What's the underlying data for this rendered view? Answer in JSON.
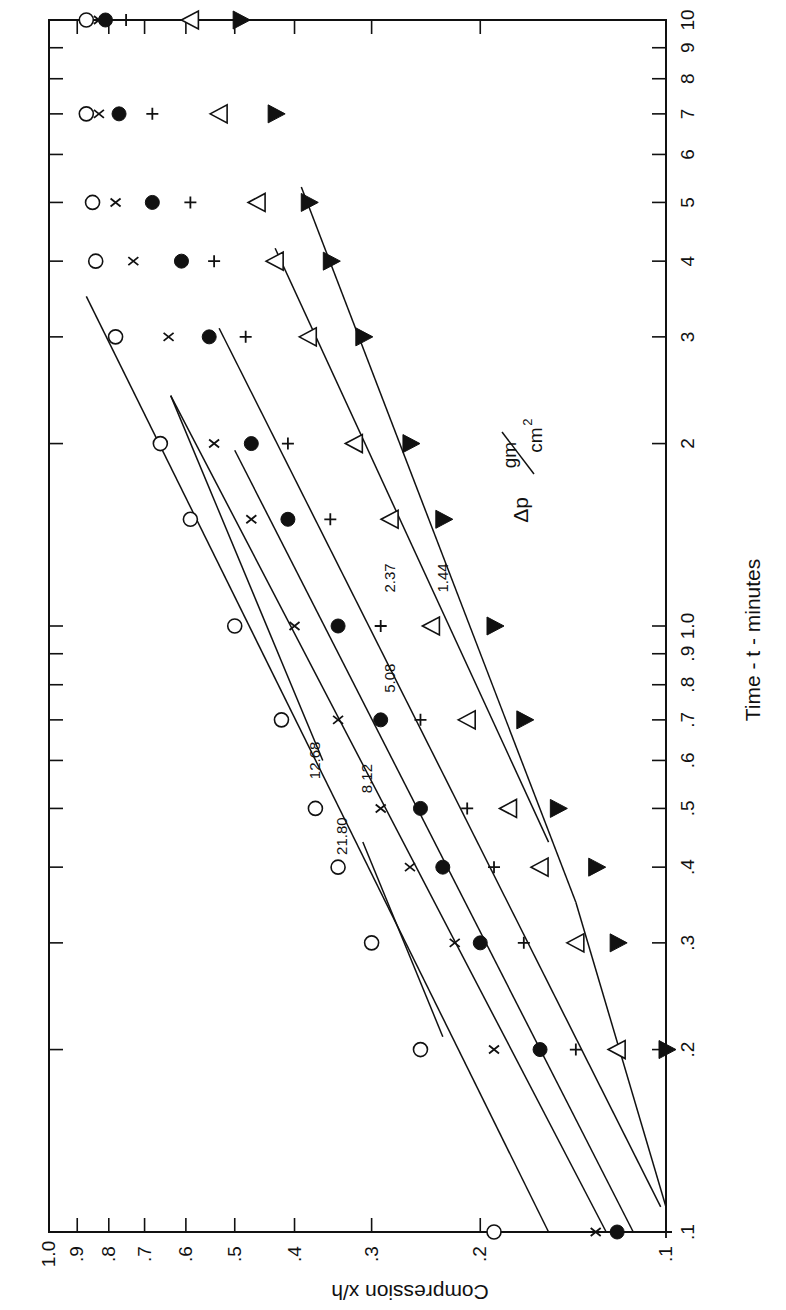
{
  "chart_data": {
    "type": "scatter",
    "orientation_note": "figure printed rotated 90 degrees counter-clockwise",
    "xlabel": "Time - t - minutes",
    "ylabel": "Compression x/h",
    "xscale": "log",
    "yscale": "log",
    "xlim": [
      0.1,
      10
    ],
    "ylim": [
      0.1,
      1.0
    ],
    "x_ticks": [
      ".1",
      ".2",
      ".3",
      ".4",
      ".5",
      ".6",
      ".7",
      ".8",
      ".9",
      "1.0",
      "2",
      "3",
      "4",
      "5",
      "6",
      "7",
      "8",
      "9",
      "10"
    ],
    "x_tick_values": [
      0.1,
      0.2,
      0.3,
      0.4,
      0.5,
      0.6,
      0.7,
      0.8,
      0.9,
      1.0,
      2,
      3,
      4,
      5,
      6,
      7,
      8,
      9,
      10
    ],
    "y_ticks": [
      ".1",
      ".2",
      ".3",
      ".4",
      ".5",
      ".6",
      ".7",
      ".8",
      ".9",
      "1.0"
    ],
    "y_tick_values": [
      0.1,
      0.2,
      0.3,
      0.4,
      0.5,
      0.6,
      0.7,
      0.8,
      0.9,
      1.0
    ],
    "legend_title": "Δp gm/cm²",
    "legend_title_parts": {
      "symbol": "Δp",
      "num": "gm",
      "den": "cm",
      "sup": "2"
    },
    "grid": false,
    "series": [
      {
        "name": "21.80",
        "marker": "open-circle",
        "x": [
          0.1,
          0.2,
          0.3,
          0.4,
          0.5,
          0.7,
          1.0,
          1.5,
          2,
          3,
          4,
          5,
          7,
          10
        ],
        "y": [
          0.19,
          0.25,
          0.3,
          0.34,
          0.37,
          0.42,
          0.5,
          0.59,
          0.66,
          0.78,
          0.84,
          0.85,
          0.87,
          0.87
        ],
        "fit": {
          "x1": 0.1,
          "y1": 0.155,
          "x2": 3.5,
          "y2": 0.87
        }
      },
      {
        "name": "12.68",
        "marker": "x",
        "x": [
          0.1,
          0.2,
          0.3,
          0.4,
          0.5,
          0.7,
          1.0,
          1.5,
          2,
          3,
          4,
          5,
          7,
          10
        ],
        "y": [
          0.13,
          0.19,
          0.22,
          0.26,
          0.29,
          0.34,
          0.4,
          0.47,
          0.54,
          0.64,
          0.73,
          0.78,
          0.83,
          0.83
        ],
        "fit": {
          "x1": 0.1,
          "y1": 0.125,
          "x2": 2.4,
          "y2": 0.635
        }
      },
      {
        "name": "8.12",
        "marker": "filled-circle",
        "x": [
          0.1,
          0.2,
          0.3,
          0.4,
          0.5,
          0.7,
          1.0,
          1.5,
          2,
          3,
          4,
          5,
          7,
          10
        ],
        "y": [
          0.12,
          0.16,
          0.2,
          0.23,
          0.25,
          0.29,
          0.34,
          0.41,
          0.47,
          0.55,
          0.61,
          0.68,
          0.77,
          0.81
        ],
        "fit": {
          "x1": 0.1,
          "y1": 0.113,
          "x2": 1.95,
          "y2": 0.5
        }
      },
      {
        "name": "5.08",
        "marker": "plus",
        "x": [
          0.1,
          0.2,
          0.3,
          0.4,
          0.5,
          0.7,
          1.0,
          1.5,
          2,
          3,
          4,
          5,
          7,
          10
        ],
        "y": [
          0.1,
          0.14,
          0.17,
          0.19,
          0.21,
          0.25,
          0.29,
          0.35,
          0.41,
          0.48,
          0.54,
          0.59,
          0.68,
          0.75
        ],
        "fit": {
          "x1": 0.11,
          "y1": 0.102,
          "x2": 3.1,
          "y2": 0.53
        }
      },
      {
        "name": "2.37",
        "marker": "open-triangle",
        "x": [
          0.2,
          0.3,
          0.4,
          0.5,
          0.7,
          1.0,
          1.5,
          2,
          3,
          4,
          5,
          7,
          10
        ],
        "y": [
          0.12,
          0.14,
          0.16,
          0.18,
          0.21,
          0.24,
          0.28,
          0.32,
          0.38,
          0.43,
          0.46,
          0.53,
          0.59
        ],
        "fit": {
          "x1": 0.44,
          "y1": 0.155,
          "x2": 4.2,
          "y2": 0.43
        }
      },
      {
        "name": "1.44",
        "marker": "filled-triangle",
        "x": [
          0.2,
          0.3,
          0.4,
          0.5,
          0.7,
          1.0,
          1.5,
          2,
          3,
          4,
          5,
          7,
          10
        ],
        "y": [
          0.1,
          0.12,
          0.13,
          0.15,
          0.17,
          0.19,
          0.23,
          0.26,
          0.31,
          0.35,
          0.38,
          0.43,
          0.49
        ],
        "fit": {
          "x1": 0.35,
          "y1": 0.14,
          "x2": 5.3,
          "y2": 0.39
        }
      }
    ],
    "extra_lines": [
      {
        "note": "short line near 21.80 label",
        "x1": 0.21,
        "y1": 0.23,
        "x2": 0.44,
        "y2": 0.31
      },
      {
        "note": "12.68 upper segment",
        "x1": 0.6,
        "y1": 0.36,
        "x2": 2.4,
        "y2": 0.635
      },
      {
        "note": "1.44 lower segment",
        "x1": 0.11,
        "y1": 0.1,
        "x2": 0.35,
        "y2": 0.14
      }
    ],
    "line_labels": [
      {
        "text": "21.80",
        "t": 0.45,
        "c": 0.335
      },
      {
        "text": "12.68",
        "t": 0.6,
        "c": 0.37
      },
      {
        "text": "8.12",
        "t": 0.56,
        "c": 0.305
      },
      {
        "text": "5.08",
        "t": 0.82,
        "c": 0.28
      },
      {
        "text": "2.37",
        "t": 1.2,
        "c": 0.28
      },
      {
        "text": "1.44",
        "t": 1.2,
        "c": 0.23
      }
    ]
  }
}
